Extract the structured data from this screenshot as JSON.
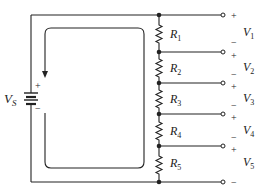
{
  "diagram": {
    "type": "series-circuit-voltage-divider",
    "source": {
      "label": "V",
      "subscript": "S",
      "plus": "+",
      "minus": "−"
    },
    "resistors": [
      {
        "label": "R",
        "subscript": "1"
      },
      {
        "label": "R",
        "subscript": "2"
      },
      {
        "label": "R",
        "subscript": "3"
      },
      {
        "label": "R",
        "subscript": "4"
      },
      {
        "label": "R",
        "subscript": "5"
      }
    ],
    "outputs": [
      {
        "label": "V",
        "subscript": "1",
        "top_sign": "+",
        "bottom_sign": "−"
      },
      {
        "label": "V",
        "subscript": "2",
        "top_sign": "+",
        "bottom_sign": "−"
      },
      {
        "label": "V",
        "subscript": "3",
        "top_sign": "+",
        "bottom_sign": "−"
      },
      {
        "label": "V",
        "subscript": "4",
        "top_sign": "+",
        "bottom_sign": "−"
      },
      {
        "label": "V",
        "subscript": "5",
        "top_sign": "+",
        "bottom_sign": "−"
      }
    ],
    "loop_arrow": "current-direction-clockwise",
    "colors": {
      "ink": "#222222",
      "background": "#ffffff"
    }
  }
}
